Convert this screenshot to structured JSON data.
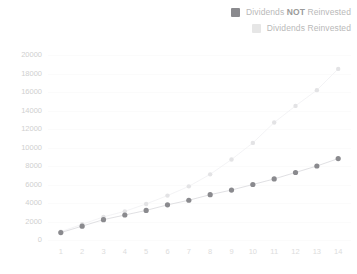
{
  "legend": {
    "position": "top-right",
    "items": [
      {
        "name": "dividends-not-reinvested",
        "label_pre": "Dividends ",
        "label_emph": "NOT",
        "label_post": " Reinvested",
        "color": "#8a8a8e"
      },
      {
        "name": "dividends-reinvested",
        "label_pre": "Dividends Reinvested",
        "label_emph": "",
        "label_post": "",
        "color": "#e6e6e6"
      }
    ]
  },
  "colors": {
    "dark_series": "#8a8a8e",
    "light_series": "#e3e3e5",
    "connector_dark": "#d8d8dc",
    "connector_light": "#f0f0f2",
    "grid": "#fbfbfb",
    "y_tick_text": "#cfcfcf",
    "x_tick_text": "#dcdcdc",
    "background": "#ffffff"
  },
  "chart_data": {
    "type": "scatter",
    "title": "",
    "subtitle": "",
    "xlabel": "",
    "ylabel": "",
    "grid": true,
    "legend_position": "top-right",
    "x": [
      1,
      2,
      3,
      4,
      5,
      6,
      7,
      8,
      9,
      10,
      11,
      12,
      13,
      14
    ],
    "xlim": [
      0.4,
      14.6
    ],
    "ylim": [
      0,
      20000
    ],
    "x_ticks": [
      1,
      2,
      3,
      4,
      5,
      6,
      7,
      8,
      9,
      10,
      11,
      12,
      13,
      14
    ],
    "x_tick_labels": [
      "1",
      "2",
      "3",
      "4",
      "5",
      "6",
      "7",
      "8",
      "9",
      "10",
      "11",
      "12",
      "13",
      "14"
    ],
    "y_ticks": [
      0,
      2000,
      4000,
      6000,
      8000,
      10000,
      12000,
      14000,
      16000,
      18000,
      20000
    ],
    "y_tick_labels": [
      "0",
      "2000",
      "4000",
      "6000",
      "8000",
      "10000",
      "12000",
      "14000",
      "16000",
      "18000",
      "20000"
    ],
    "series": [
      {
        "name": "Dividends NOT Reinvested",
        "color": "#8a8a8e",
        "marker": "circle",
        "values": [
          800,
          1500,
          2200,
          2700,
          3200,
          3800,
          4300,
          4900,
          5400,
          6000,
          6600,
          7300,
          8000,
          8800
        ]
      },
      {
        "name": "Dividends Reinvested",
        "color": "#e3e3e5",
        "marker": "circle",
        "values": [
          900,
          1700,
          2500,
          3100,
          3900,
          4800,
          5800,
          7100,
          8700,
          10500,
          12700,
          14500,
          16200,
          18500
        ]
      }
    ]
  }
}
